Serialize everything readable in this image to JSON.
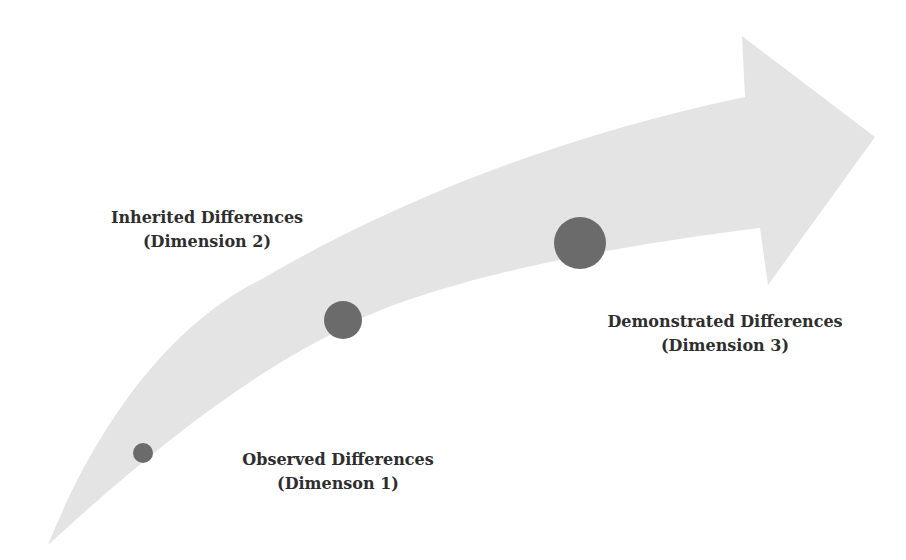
{
  "diagram": {
    "arrow": {
      "fill": "#e4e4e4"
    },
    "dots_color": "#6b6b6b",
    "stages": [
      {
        "title": "Observed Differences",
        "subtitle": "(Dimenson 1)",
        "dot": {
          "cx": 143,
          "cy": 453,
          "r": 10
        }
      },
      {
        "title": "Inherited Differences",
        "subtitle": "(Dimension 2)",
        "dot": {
          "cx": 343,
          "cy": 320,
          "r": 19
        }
      },
      {
        "title": "Demonstrated Differences",
        "subtitle": "(Dimension 3)",
        "dot": {
          "cx": 580,
          "cy": 243,
          "r": 26
        }
      }
    ]
  }
}
